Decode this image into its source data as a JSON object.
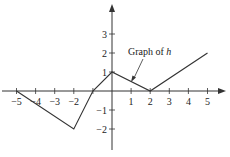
{
  "chart_data": {
    "type": "line",
    "title": "",
    "annotation": {
      "text_prefix": "Graph of ",
      "text_var": "h",
      "points_to": [
        1,
        0.5
      ]
    },
    "series": [
      {
        "name": "h",
        "x": [
          -5,
          -2,
          -1,
          0,
          2,
          5
        ],
        "values": [
          0,
          -2,
          0,
          1,
          0,
          2
        ]
      }
    ],
    "xlabel": "",
    "ylabel": "",
    "x_ticks": [
      -5,
      -4,
      -3,
      -2,
      -1,
      1,
      2,
      3,
      4,
      5
    ],
    "x_tick_labels": [
      "−5",
      "−4",
      "−3",
      "−2",
      "",
      "1",
      "2",
      "3",
      "4",
      "5"
    ],
    "y_ticks": [
      -2,
      -1,
      1,
      2,
      3
    ],
    "y_tick_labels": [
      "−2",
      "−1",
      "1",
      "2",
      "3"
    ],
    "xlim": [
      -5.5,
      5.8
    ],
    "ylim": [
      -3,
      4.5
    ],
    "grid": false,
    "line_color": "#333333"
  }
}
